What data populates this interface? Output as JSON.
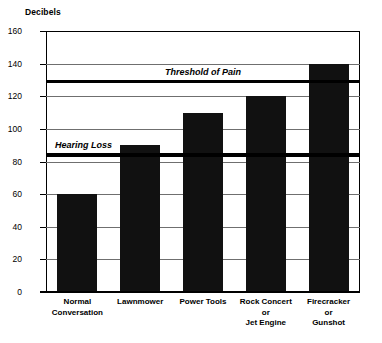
{
  "chart_data": {
    "type": "bar",
    "title": "",
    "xlabel": "",
    "ylabel": "Decibels",
    "ylim": [
      0,
      160
    ],
    "ytick_step": 20,
    "yticks": [
      160,
      140,
      120,
      100,
      80,
      60,
      40,
      20,
      0
    ],
    "grid": true,
    "legend": "none",
    "bar_color": "#111111",
    "categories": [
      "Normal Conversation",
      "Lawnmower",
      "Power Tools",
      "Rock Concert or Jet Engine",
      "Firecracker or Gunshot"
    ],
    "category_label_lines": [
      [
        "Normal",
        "Conversation"
      ],
      [
        "Lawnmower"
      ],
      [
        "Power Tools"
      ],
      [
        "Rock Concert",
        "or",
        "Jet Engine"
      ],
      [
        "Firecracker",
        "or",
        "Gunshot"
      ]
    ],
    "values": [
      60,
      90,
      110,
      120,
      140
    ],
    "annotations": [
      {
        "label": "Threshold of Pain",
        "value": 130
      },
      {
        "label": "Hearing Loss",
        "value": 85
      }
    ]
  }
}
